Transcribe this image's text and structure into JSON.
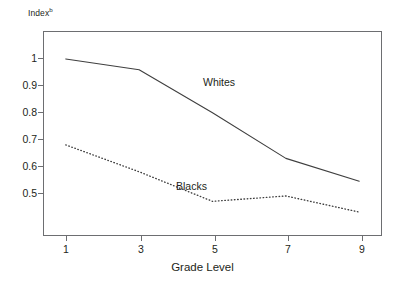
{
  "chart_data": {
    "type": "line",
    "title": "",
    "xlabel": "Grade Level",
    "ylabel": "Index",
    "ylabel_superscript": "b",
    "x": [
      1,
      3,
      5,
      7,
      9
    ],
    "xticks": [
      "1",
      "3",
      "5",
      "7",
      "9"
    ],
    "yticks": [
      "1",
      "0.9",
      "0.8",
      "0.7",
      "0.6",
      "0.5"
    ],
    "ytick_values": [
      1,
      0.9,
      0.8,
      0.7,
      0.6,
      0.5
    ],
    "xlim": [
      0.38,
      9.62
    ],
    "ylim": [
      0.341,
      1.104
    ],
    "grid": false,
    "legend_position": "inline-annotation",
    "series": [
      {
        "name": "Whites",
        "style": "solid",
        "color": "#3f3f3f",
        "values": [
          1.0,
          0.96,
          0.8,
          0.63,
          0.545
        ]
      },
      {
        "name": "Blacks",
        "style": "dotted",
        "color": "#3f3f3f",
        "values": [
          0.68,
          0.58,
          0.47,
          0.49,
          0.43
        ]
      }
    ],
    "annotations": [
      {
        "text": "Whites",
        "x": 5.3,
        "y": 0.94
      },
      {
        "text": "Blacks",
        "x": 4.1,
        "y": 0.565
      }
    ],
    "colors": {
      "axis": "#6d6e71",
      "text": "#231f20",
      "line": "#3f3f3f",
      "background": "#ffffff"
    }
  }
}
